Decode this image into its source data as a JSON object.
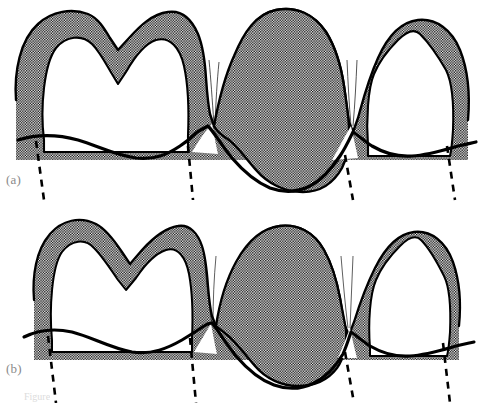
{
  "figure": {
    "width": 479,
    "height": 403,
    "background_color": "#ffffff",
    "outline_color": "#000000",
    "stipple_color": "#000000",
    "label_color": "#8a8a8a",
    "caption_sliver_text": "Figure"
  },
  "panels": [
    {
      "id": "a",
      "label": "(a)",
      "description": "Thick stippled deposit band surrounding the crowns; middle tooth fully stippled; gingival margin drawn as heavy wavy line with dashed root axes below",
      "deposit_thickness": "thick",
      "teeth": [
        {
          "name": "left-premolar",
          "fill": "outlined-with-thick-stipple-band",
          "cusps": 2
        },
        {
          "name": "middle-molar",
          "fill": "fully-stippled",
          "cusps": 0
        },
        {
          "name": "right-molar",
          "fill": "outlined-with-thick-stipple-band",
          "cusps": 1
        }
      ],
      "dashed_root_axes": 4
    },
    {
      "id": "b",
      "label": "(b)",
      "description": "Thinner stippled deposit band; interproximal wedges extend apically; middle tooth fully stippled; gingival margin recontoured",
      "deposit_thickness": "thin",
      "teeth": [
        {
          "name": "left-premolar",
          "fill": "outlined-with-thin-stipple-band",
          "cusps": 2
        },
        {
          "name": "middle-molar",
          "fill": "fully-stippled",
          "cusps": 0
        },
        {
          "name": "right-molar",
          "fill": "outlined-with-thin-stipple-band",
          "cusps": 1
        }
      ],
      "dashed_root_axes": 4
    }
  ]
}
